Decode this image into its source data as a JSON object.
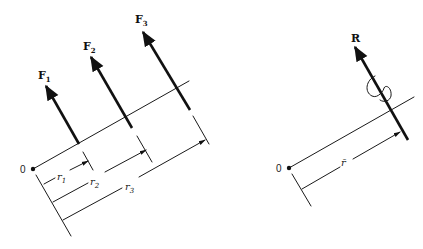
{
  "diagram": {
    "left": {
      "origin_label": "0",
      "forces": [
        {
          "name": "F",
          "sub": "1"
        },
        {
          "name": "F",
          "sub": "2"
        },
        {
          "name": "F",
          "sub": "3"
        }
      ],
      "distances": [
        {
          "name": "r",
          "sub": "1"
        },
        {
          "name": "r",
          "sub": "2"
        },
        {
          "name": "r",
          "sub": "3"
        }
      ]
    },
    "right": {
      "origin_label": "0",
      "resultant": "R",
      "distance": "r̄",
      "couple_symbol": "moment-loop"
    },
    "colors": {
      "ink": "#111111",
      "background": "#ffffff"
    }
  }
}
